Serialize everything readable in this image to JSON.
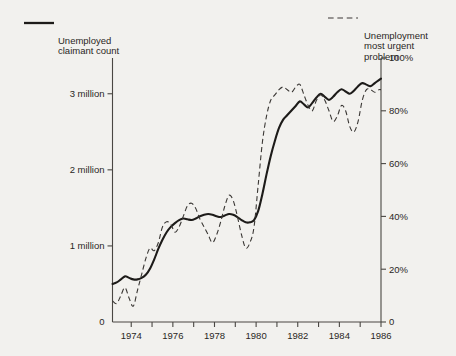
{
  "legend": {
    "solid": {
      "label": "Unemployed\nclaimant count",
      "style": "solid",
      "color": "#1d1b19"
    },
    "dashed": {
      "label": "Unemployment\nmost urgent\nproblem",
      "style": "dashed",
      "color": "#3a3734"
    }
  },
  "chart_data": {
    "type": "line",
    "title": "",
    "subtitle": "",
    "xlabel": "",
    "ylabel": "",
    "grid": false,
    "legend_position": "top",
    "xlim": [
      1973.1,
      1986.0
    ],
    "x_ticks": [
      1973,
      1974,
      1975,
      1976,
      1977,
      1978,
      1979,
      1980,
      1981,
      1982,
      1983,
      1984,
      1985,
      1986
    ],
    "x_tick_labels": [
      "",
      "1974",
      "",
      "1976",
      "",
      "1978",
      "",
      "1980",
      "",
      "1982",
      "",
      "1984",
      "",
      "1986"
    ],
    "axes": [
      {
        "id": "left",
        "side": "left",
        "label": "",
        "ylim": [
          0,
          3.47
        ],
        "ticks": [
          0,
          1,
          2,
          3
        ],
        "tick_labels": [
          "0",
          "1 million",
          "2 million",
          "3 million"
        ],
        "unit": "million"
      },
      {
        "id": "right",
        "side": "right",
        "label": "",
        "ylim": [
          0,
          100
        ],
        "ticks": [
          0,
          20,
          40,
          60,
          80,
          100
        ],
        "tick_labels": [
          "0",
          "20%",
          "40%",
          "60%",
          "80%",
          "100%"
        ],
        "unit": "percent"
      }
    ],
    "series": [
      {
        "name": "Unemployed claimant count",
        "axis": "left",
        "style": "solid",
        "color": "#1d1b19",
        "unit": "million",
        "x": [
          1973.1,
          1973.3,
          1973.5,
          1973.7,
          1973.9,
          1974.1,
          1974.3,
          1974.5,
          1974.7,
          1974.9,
          1975.1,
          1975.3,
          1975.5,
          1975.7,
          1975.9,
          1976.1,
          1976.3,
          1976.5,
          1976.7,
          1976.9,
          1977.1,
          1977.3,
          1977.5,
          1977.7,
          1977.9,
          1978.1,
          1978.3,
          1978.5,
          1978.7,
          1978.9,
          1979.1,
          1979.3,
          1979.5,
          1979.7,
          1979.9,
          1980.1,
          1980.3,
          1980.5,
          1980.7,
          1980.9,
          1981.1,
          1981.3,
          1981.5,
          1981.7,
          1981.9,
          1982.1,
          1982.3,
          1982.5,
          1982.7,
          1982.9,
          1983.1,
          1983.3,
          1983.5,
          1983.7,
          1983.9,
          1984.1,
          1984.3,
          1984.5,
          1984.7,
          1984.9,
          1985.1,
          1985.3,
          1985.5,
          1985.7,
          1985.9,
          1986.0
        ],
        "y": [
          0.5,
          0.52,
          0.56,
          0.6,
          0.58,
          0.56,
          0.56,
          0.58,
          0.62,
          0.7,
          0.82,
          0.96,
          1.08,
          1.18,
          1.25,
          1.3,
          1.34,
          1.36,
          1.35,
          1.34,
          1.36,
          1.39,
          1.41,
          1.42,
          1.41,
          1.39,
          1.38,
          1.4,
          1.42,
          1.41,
          1.38,
          1.34,
          1.31,
          1.31,
          1.34,
          1.46,
          1.68,
          1.94,
          2.18,
          2.38,
          2.55,
          2.66,
          2.72,
          2.78,
          2.84,
          2.9,
          2.86,
          2.82,
          2.88,
          2.95,
          3.0,
          2.96,
          2.92,
          2.96,
          3.02,
          3.06,
          3.03,
          3.0,
          3.04,
          3.1,
          3.14,
          3.12,
          3.1,
          3.14,
          3.18,
          3.2
        ]
      },
      {
        "name": "Unemployment most urgent problem",
        "axis": "right",
        "style": "dashed",
        "color": "#3a3734",
        "unit": "percent",
        "x": [
          1973.1,
          1973.3,
          1973.5,
          1973.7,
          1973.9,
          1974.1,
          1974.3,
          1974.5,
          1974.7,
          1974.9,
          1975.1,
          1975.3,
          1975.5,
          1975.7,
          1975.9,
          1976.1,
          1976.3,
          1976.5,
          1976.7,
          1976.9,
          1977.1,
          1977.3,
          1977.5,
          1977.7,
          1977.9,
          1978.1,
          1978.3,
          1978.5,
          1978.7,
          1978.9,
          1979.1,
          1979.3,
          1979.5,
          1979.7,
          1979.9,
          1980.1,
          1980.3,
          1980.5,
          1980.7,
          1980.9,
          1981.1,
          1981.3,
          1981.5,
          1981.7,
          1981.9,
          1982.1,
          1982.3,
          1982.5,
          1982.7,
          1982.9,
          1983.1,
          1983.3,
          1983.5,
          1983.7,
          1983.9,
          1984.1,
          1984.3,
          1984.5,
          1984.7,
          1984.9,
          1985.1,
          1985.3,
          1985.5,
          1985.7,
          1985.9,
          1986.0
        ],
        "y": [
          8,
          7,
          10,
          13,
          9,
          6,
          12,
          18,
          24,
          28,
          27,
          30,
          36,
          38,
          37,
          34,
          36,
          40,
          44,
          45,
          43,
          39,
          36,
          33,
          30,
          33,
          38,
          44,
          48,
          46,
          40,
          33,
          28,
          30,
          36,
          52,
          68,
          78,
          84,
          86,
          88,
          89,
          88,
          87,
          89,
          90,
          86,
          82,
          80,
          84,
          86,
          84,
          80,
          76,
          78,
          82,
          80,
          74,
          72,
          76,
          84,
          88,
          88,
          87,
          88,
          88
        ]
      }
    ],
    "annotations": []
  }
}
